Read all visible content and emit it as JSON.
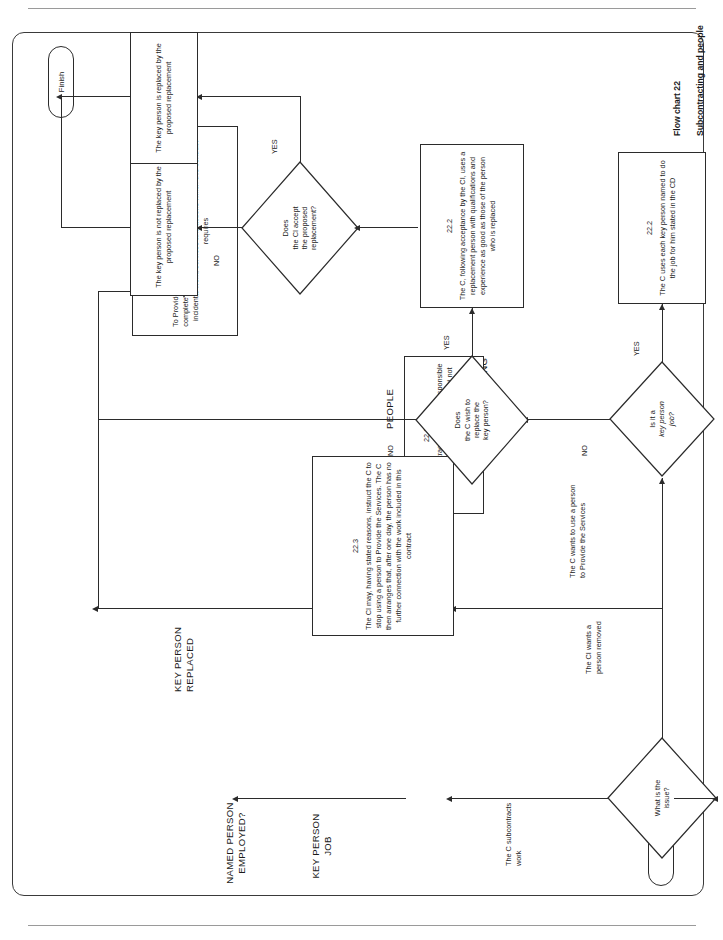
{
  "document": {
    "caption_line1": "Flow chart 22",
    "caption_line2": "Subcontracting and people"
  },
  "flowchart": {
    "title": "Flow chart 22 — Subcontracting and people",
    "start_label": "Start",
    "finish_label": "Finish",
    "group_labels": {
      "subcontracting": "SUBCONTRACTING",
      "people": "PEOPLE",
      "key_person_job": "KEY PERSON\nJOB",
      "named_person_employed": "NAMED PERSON\nEMPLOYED?",
      "key_person_replaced": "KEY PERSON\nREPLACED"
    },
    "decisions": [
      {
        "id": "what-is-the-issue",
        "text": "What is the\nissue?",
        "branches": [
          "The C subcontracts\nwork",
          "The CI wants a\nperson removed",
          "The C wants to use a person\nto Provide the Services"
        ]
      },
      {
        "id": "is-it-a-key-person-job",
        "line1": "Is it a",
        "line2": "key person",
        "line3": "job?",
        "yes": "YES",
        "no": "NO"
      },
      {
        "id": "does-c-wish-to-replace-key-person",
        "line1": "Does",
        "line2": "the C wish to",
        "line3": "replace the",
        "line4": "key person?",
        "yes": "YES",
        "no": "NO"
      },
      {
        "id": "does-ci-accept-proposed-replacement",
        "line1": "Does",
        "line2": "the CI accept",
        "line3": "the proposed",
        "line4": "replacement?",
        "yes": "YES",
        "no": "NO"
      }
    ],
    "boxes": [
      {
        "id": "provide-the-services",
        "clause": "11.2(6)",
        "text": "To Provide the Services means to do the work necessary to complete the services in accordance with the Scope and all incidental work, services and actions which this contract requires"
      },
      {
        "id": "subcontract-responsibility",
        "clause": "22.1",
        "text": "If the C subcontracts work, he is responsible for Providing the Services as if he had not subcontracted"
      },
      {
        "id": "ci-may-instruct-stop-using-person",
        "clause": "22.3",
        "text": "The CI may, having stated reasons, instruct the C to stop using a person to Provide the Services. The C then arranges that, after one day, the person has no further connection with the work included in this contract"
      },
      {
        "id": "key-person-named-in-cd",
        "clause": "22.2",
        "text": "The C uses each key person named to do the job for him stated in the CD"
      },
      {
        "id": "replacement-person-qualifications",
        "clause": "22.2",
        "text": "The C, following acceptance by the CI, uses a replacement person with qualifications and experience as good as those of the person who is replaced"
      },
      {
        "id": "key-person-not-replaced",
        "clause": "",
        "text": "The key person is not replaced by the proposed replacement"
      },
      {
        "id": "key-person-replaced",
        "clause": "",
        "text": "The key person is replaced by the proposed replacement"
      }
    ]
  }
}
